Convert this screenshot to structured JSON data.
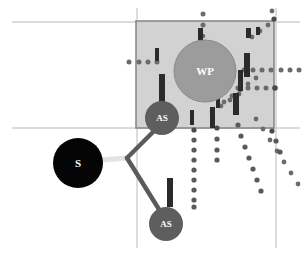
{
  "figure": {
    "title": "",
    "type": "network-diagram",
    "width": 304,
    "height": 262,
    "background": "#ffffff"
  },
  "colors": {
    "region_fill": "#d2d2d2",
    "region_stroke": "#8a8a8a",
    "gridline": "#cfcfcf",
    "node_source": "#050505",
    "node_as": "#5e5e5e",
    "node_wp": "#9c9c9c",
    "node_wp_stroke": "#8a8a8a",
    "bar": "#2b2b2b",
    "link_dark": "#5b5b5b",
    "link_light": "#e2e2e2",
    "dot": "#6b6b6b",
    "label_text": "#ffffff"
  },
  "region": {
    "name": "coverage-area",
    "x": 136,
    "y": 21,
    "width": 138,
    "height": 107
  },
  "gridlines": {
    "horizontal": [
      {
        "name": "gridline-top",
        "y": 22,
        "x1": 12,
        "x2": 300
      },
      {
        "name": "gridline-bottom",
        "y": 128,
        "x1": 12,
        "x2": 300
      }
    ],
    "vertical": [
      {
        "name": "gridline-left",
        "x": 137,
        "y1": 8,
        "y2": 248
      },
      {
        "name": "gridline-right",
        "x": 276,
        "y1": 8,
        "y2": 248
      }
    ]
  },
  "nodes": [
    {
      "id": "S",
      "label": "S",
      "x": 78,
      "y": 163,
      "r": 25,
      "kind": "source"
    },
    {
      "id": "AS1",
      "label": "AS",
      "x": 162,
      "y": 118,
      "r": 17,
      "kind": "access"
    },
    {
      "id": "AS2",
      "label": "AS",
      "x": 166,
      "y": 224,
      "r": 17,
      "kind": "access"
    },
    {
      "id": "WP",
      "label": "WP",
      "x": 205,
      "y": 71,
      "r": 31,
      "kind": "waypoint"
    }
  ],
  "links": [
    {
      "name": "link-source-junction",
      "from": "S",
      "to": "J",
      "style": "light",
      "x1": 103,
      "y1": 160,
      "x2": 126,
      "y2": 158
    },
    {
      "name": "link-junction-as1",
      "from": "J",
      "to": "AS1",
      "style": "dark",
      "x1": 126,
      "y1": 158,
      "x2": 154,
      "y2": 131
    },
    {
      "name": "link-junction-as2",
      "from": "J",
      "to": "AS2",
      "style": "dark",
      "x1": 126,
      "y1": 158,
      "x2": 160,
      "y2": 211
    }
  ],
  "bars": [
    {
      "name": "bar-1",
      "x": 155,
      "y": 48,
      "w": 4,
      "h": 13
    },
    {
      "name": "bar-2",
      "x": 159,
      "y": 74,
      "w": 6,
      "h": 28
    },
    {
      "name": "bar-3",
      "x": 198,
      "y": 28,
      "w": 5,
      "h": 13
    },
    {
      "name": "bar-4",
      "x": 246,
      "y": 28,
      "w": 5,
      "h": 10
    },
    {
      "name": "bar-5",
      "x": 256,
      "y": 27,
      "w": 4,
      "h": 8
    },
    {
      "name": "bar-6",
      "x": 244,
      "y": 53,
      "w": 6,
      "h": 24
    },
    {
      "name": "bar-7",
      "x": 238,
      "y": 70,
      "w": 5,
      "h": 21
    },
    {
      "name": "bar-8",
      "x": 233,
      "y": 93,
      "w": 6,
      "h": 22
    },
    {
      "name": "bar-9",
      "x": 216,
      "y": 97,
      "w": 4,
      "h": 11
    },
    {
      "name": "bar-10",
      "x": 190,
      "y": 110,
      "w": 4,
      "h": 15
    },
    {
      "name": "bar-11",
      "x": 210,
      "y": 107,
      "w": 5,
      "h": 21
    },
    {
      "name": "bar-12",
      "x": 167,
      "y": 178,
      "w": 6,
      "h": 29
    }
  ],
  "dot_rays": [
    {
      "name": "dot-ray-horizontal-left",
      "points": [
        [
          129,
          62
        ],
        [
          139,
          62
        ],
        [
          148,
          62
        ],
        [
          157,
          62
        ]
      ]
    },
    {
      "name": "dot-ray-top-vertical",
      "points": [
        [
          203,
          14
        ],
        [
          203,
          25
        ],
        [
          203,
          36
        ],
        [
          203,
          43
        ]
      ]
    },
    {
      "name": "dot-ray-upper-right-cluster",
      "points": [
        [
          252,
          37
        ],
        [
          260,
          31
        ],
        [
          268,
          25
        ],
        [
          276,
          20
        ],
        [
          273,
          12
        ]
      ]
    },
    {
      "name": "dot-ray-horizontal-right",
      "points": [
        [
          244,
          70
        ],
        [
          253,
          70
        ],
        [
          262,
          70
        ],
        [
          271,
          70
        ],
        [
          281,
          70
        ],
        [
          290,
          70
        ],
        [
          299,
          70
        ]
      ]
    },
    {
      "name": "dot-ray-horizontal-right-lower",
      "points": [
        [
          238,
          88
        ],
        [
          248,
          88
        ],
        [
          257,
          88
        ],
        [
          266,
          88
        ],
        [
          276,
          88
        ]
      ]
    },
    {
      "name": "dot-ray-diagonal-a",
      "points": [
        [
          224,
          102
        ],
        [
          232,
          96
        ],
        [
          240,
          90
        ],
        [
          248,
          84
        ],
        [
          256,
          78
        ]
      ]
    },
    {
      "name": "dot-ray-diagonal-b",
      "points": [
        [
          212,
          112
        ],
        [
          221,
          106
        ],
        [
          230,
          100
        ],
        [
          239,
          94
        ]
      ]
    },
    {
      "name": "dot-ray-vertical-long",
      "points": [
        [
          194,
          130
        ],
        [
          194,
          140
        ],
        [
          194,
          150
        ],
        [
          194,
          160
        ],
        [
          194,
          170
        ],
        [
          194,
          180
        ],
        [
          194,
          190
        ],
        [
          194,
          200
        ],
        [
          194,
          207
        ]
      ]
    },
    {
      "name": "dot-ray-vertical-short",
      "points": [
        [
          217,
          128
        ],
        [
          217,
          139
        ],
        [
          217,
          150
        ],
        [
          217,
          160
        ]
      ]
    },
    {
      "name": "dot-ray-diagonal-c",
      "points": [
        [
          238,
          125
        ],
        [
          241,
          136
        ],
        [
          245,
          147
        ],
        [
          249,
          158
        ],
        [
          253,
          169
        ],
        [
          257,
          180
        ],
        [
          261,
          191
        ]
      ]
    },
    {
      "name": "dot-ray-diagonal-d",
      "points": [
        [
          256,
          119
        ],
        [
          263,
          129
        ],
        [
          270,
          140
        ],
        [
          277,
          151
        ],
        [
          284,
          162
        ],
        [
          291,
          173
        ],
        [
          298,
          184
        ]
      ]
    },
    {
      "name": "dot-ray-bottom-right-tail",
      "points": [
        [
          272,
          131
        ],
        [
          276,
          141
        ],
        [
          280,
          152
        ]
      ]
    }
  ]
}
